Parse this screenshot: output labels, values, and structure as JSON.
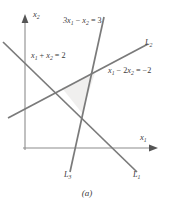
{
  "figure": {
    "caption": "(a)",
    "axes": {
      "x_label": "x",
      "x_label_sub": "1",
      "y_label": "x",
      "y_label_sub": "2",
      "origin_x": 25,
      "origin_y": 148
    },
    "colors": {
      "line": "#7a7a7a",
      "axis": "#8c8c8c",
      "text": "#3a3a3a",
      "region_fill": "#f0efee",
      "background": "#ffffff"
    },
    "equations": [
      {
        "id": "eq-L1",
        "text": "x",
        "sub1": "1",
        "op1": " + ",
        "var2": "x",
        "sub2": "2",
        "rhs": " = 2",
        "full": "x1 + x2 = 2",
        "x": 31,
        "y": 58
      },
      {
        "id": "eq-L3",
        "text": "3x",
        "sub1": "1",
        "op1": " − ",
        "var2": "x",
        "sub2": "2",
        "rhs": " = 3",
        "full": "3x1 - x2 = 3",
        "x": 63,
        "y": 23
      },
      {
        "id": "eq-L2",
        "text": "x",
        "sub1": "1",
        "op1": " − 2",
        "var2": "x",
        "sub2": "2",
        "rhs": " = −2",
        "full": "x1 - 2x2 = -2",
        "x": 108,
        "y": 73
      }
    ],
    "line_labels": [
      {
        "id": "label-L2",
        "name": "L",
        "sub": "2",
        "x": 145,
        "y": 45
      },
      {
        "id": "label-L3",
        "name": "L",
        "sub": "3",
        "x": 64,
        "y": 177
      },
      {
        "id": "label-L1",
        "name": "L",
        "sub": "1",
        "x": 133,
        "y": 177
      }
    ],
    "lines": [
      {
        "id": "line-L1",
        "name": "L1",
        "x1": 3,
        "y1": 42,
        "x2": 137,
        "y2": 172
      },
      {
        "id": "line-L2",
        "name": "L2",
        "x1": 8,
        "y1": 118,
        "x2": 148,
        "y2": 44
      },
      {
        "id": "line-L3",
        "name": "L3",
        "x1": 104,
        "y1": 17,
        "x2": 70,
        "y2": 172
      }
    ],
    "feasible_region": {
      "id": "feasible-region",
      "points": "62,88 95,73 82,113"
    }
  }
}
